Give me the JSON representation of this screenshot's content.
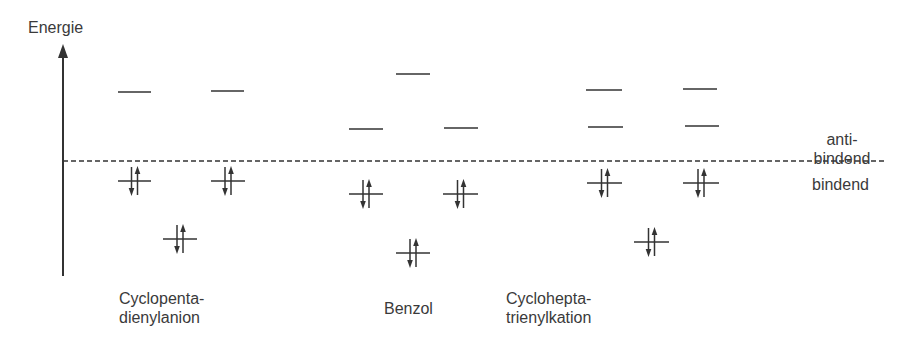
{
  "axis": {
    "label": "Energie"
  },
  "regions": {
    "antibonding": "anti-\nbindend",
    "antibonding_line1": "anti-",
    "antibonding_line2": "bindend",
    "bonding": "bindend"
  },
  "molecules": [
    {
      "name_line1": "Cyclopenta-",
      "name_line2": "dienylanion",
      "levels": [
        {
          "x1": 118,
          "x2": 151,
          "y": 92,
          "electrons": 0
        },
        {
          "x1": 211,
          "x2": 244,
          "y": 91,
          "electrons": 0
        },
        {
          "x1": 118,
          "x2": 151,
          "y": 181,
          "electrons": 2
        },
        {
          "x1": 211,
          "x2": 245,
          "y": 181,
          "electrons": 2
        },
        {
          "x1": 163,
          "x2": 197,
          "y": 239,
          "electrons": 2
        }
      ]
    },
    {
      "name_line1": "Benzol",
      "name_line2": "",
      "levels": [
        {
          "x1": 396,
          "x2": 430,
          "y": 74,
          "electrons": 0
        },
        {
          "x1": 349,
          "x2": 383,
          "y": 129,
          "electrons": 0
        },
        {
          "x1": 444,
          "x2": 478,
          "y": 128,
          "electrons": 0
        },
        {
          "x1": 349,
          "x2": 383,
          "y": 194,
          "electrons": 2
        },
        {
          "x1": 443,
          "x2": 478,
          "y": 194,
          "electrons": 2
        },
        {
          "x1": 396,
          "x2": 430,
          "y": 253,
          "electrons": 2
        }
      ]
    },
    {
      "name_line1": "Cyclohepta-",
      "name_line2": "trienylkation",
      "levels": [
        {
          "x1": 586,
          "x2": 622,
          "y": 90,
          "electrons": 0
        },
        {
          "x1": 683,
          "x2": 717,
          "y": 89,
          "electrons": 0
        },
        {
          "x1": 588,
          "x2": 623,
          "y": 127,
          "electrons": 0
        },
        {
          "x1": 685,
          "x2": 719,
          "y": 126,
          "electrons": 0
        },
        {
          "x1": 587,
          "x2": 622,
          "y": 183,
          "electrons": 2
        },
        {
          "x1": 683,
          "x2": 719,
          "y": 183,
          "electrons": 2
        },
        {
          "x1": 634,
          "x2": 669,
          "y": 242,
          "electrons": 2
        }
      ]
    }
  ],
  "colors": {
    "ink": "#333333",
    "text": "#3a3a3a",
    "background": "#ffffff"
  }
}
